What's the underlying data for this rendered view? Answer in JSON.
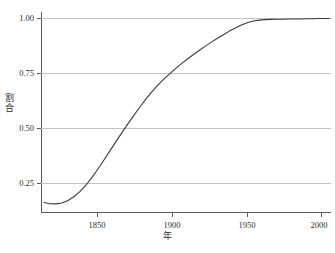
{
  "chart_data": {
    "type": "line",
    "title": "",
    "subtitle": "",
    "xlabel": "年",
    "ylabel": "割合",
    "xlim": [
      1818,
      2012
    ],
    "ylim": [
      0.13,
      1.02
    ],
    "grid": true,
    "legend": false,
    "legend_position": "none",
    "xticks": [
      1850,
      1900,
      1950,
      2000
    ],
    "xtick_labels": [
      "1850",
      "1900",
      "1950",
      "2000"
    ],
    "yticks": [
      0.25,
      0.5,
      0.75,
      1.0
    ],
    "ytick_labels": [
      "0.25",
      "0.50",
      "0.75",
      "1.00"
    ],
    "line_color": "#3b3b3b",
    "grid_color": "#c2c2c2",
    "axis_color": "#5a5a5a",
    "background_color": "#ffffff",
    "series": [
      {
        "name": "割合",
        "x": [
          1820,
          1824,
          1828,
          1832,
          1836,
          1840,
          1844,
          1848,
          1852,
          1856,
          1860,
          1864,
          1868,
          1872,
          1876,
          1880,
          1884,
          1888,
          1892,
          1896,
          1900,
          1904,
          1908,
          1912,
          1916,
          1920,
          1924,
          1928,
          1932,
          1936,
          1940,
          1944,
          1948,
          1952,
          1956,
          1960,
          1964,
          1968,
          1972,
          1976,
          1980,
          1984,
          1988,
          1992,
          1996,
          2000,
          2004,
          2008,
          2011
        ],
        "y": [
          0.172,
          0.167,
          0.166,
          0.17,
          0.181,
          0.198,
          0.221,
          0.249,
          0.283,
          0.32,
          0.36,
          0.401,
          0.442,
          0.482,
          0.521,
          0.559,
          0.596,
          0.631,
          0.663,
          0.693,
          0.72,
          0.745,
          0.768,
          0.79,
          0.811,
          0.831,
          0.85,
          0.868,
          0.886,
          0.903,
          0.919,
          0.935,
          0.949,
          0.962,
          0.972,
          0.98,
          0.984,
          0.986,
          0.987,
          0.988,
          0.988,
          0.989,
          0.989,
          0.989,
          0.99,
          0.99,
          0.991,
          0.991,
          0.991
        ]
      }
    ]
  },
  "axes": {
    "y_title_chars": [
      "割",
      "合"
    ],
    "x_title": "年"
  }
}
